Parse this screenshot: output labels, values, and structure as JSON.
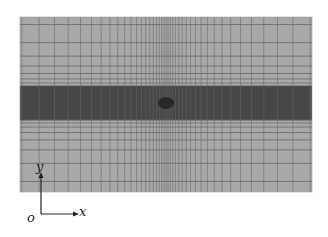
{
  "figure": {
    "type": "computational mesh",
    "frame": {
      "x": 20,
      "y": 17,
      "width": 292,
      "height": 175
    },
    "colors": {
      "background": "#a8a8a8",
      "band": "#4a4a4a",
      "line": "#6a6a6a",
      "band_line": "#3a3a3a",
      "center_dark": "#1a1a1a"
    },
    "band": {
      "y_top": 86,
      "y_bottom": 120
    },
    "center": {
      "x": 166,
      "y": 103
    }
  },
  "axes": {
    "origin_label": "o",
    "x_label": "x",
    "y_label": "y",
    "origin": {
      "x": 41,
      "y": 214
    },
    "x_end": {
      "x": 76,
      "y": 214
    },
    "y_end": {
      "x": 41,
      "y": 175
    }
  }
}
